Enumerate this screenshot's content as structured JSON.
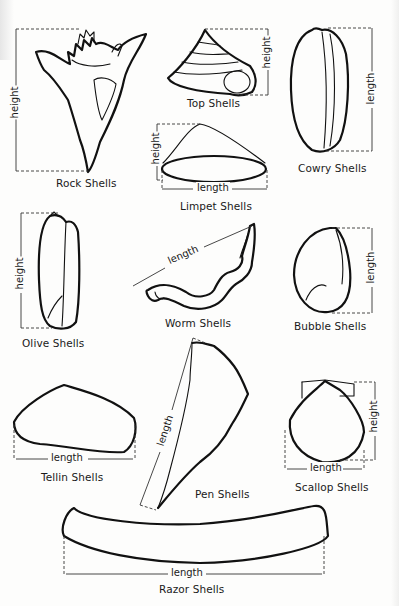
{
  "shells": [
    {
      "name": "Rock Shells",
      "measure": "height"
    },
    {
      "name": "Top Shells",
      "measure": "height"
    },
    {
      "name": "Cowry Shells",
      "measure": "length"
    },
    {
      "name": "Limpet Shells",
      "measures": [
        "height",
        "length"
      ]
    },
    {
      "name": "Olive Shells",
      "measure": "height"
    },
    {
      "name": "Worm Shells",
      "measure": "length"
    },
    {
      "name": "Bubble Shells",
      "measure": "length"
    },
    {
      "name": "Tellin Shells",
      "measure": "length"
    },
    {
      "name": "Pen Shells",
      "measure": "length"
    },
    {
      "name": "Scallop Shells",
      "measures": [
        "length",
        "height"
      ]
    },
    {
      "name": "Razor Shells",
      "measure": "length"
    }
  ],
  "dims": {
    "height": "height",
    "length": "length"
  },
  "colors": {
    "ink": "#111111",
    "paper": "#fdfdfc"
  }
}
